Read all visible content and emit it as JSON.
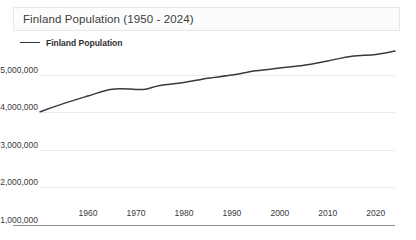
{
  "title": "Finland Population (1950 - 2024)",
  "legend": {
    "label": "Finland Population",
    "marker": "line-swatch-icon"
  },
  "colors": {
    "line": "#3a3a3a",
    "gridline": "#ebebeb",
    "axis": "#8c8c8c",
    "text": "#3a3a3a",
    "title_border": "#e8e8e8",
    "background": "#ffffff"
  },
  "chart_data": {
    "type": "line",
    "title": "Finland Population (1950 - 2024)",
    "xlabel": "",
    "ylabel": "",
    "xlim": [
      1950,
      2024
    ],
    "ylim": [
      1000000,
      5600000
    ],
    "grid": true,
    "legend_position": "top-left",
    "xticks": [
      1960,
      1970,
      1980,
      1990,
      2000,
      2010,
      2020
    ],
    "xtick_labels": [
      "1960",
      "1970",
      "1980",
      "1990",
      "2000",
      "2010",
      "2020"
    ],
    "yticks": [
      1000000,
      2000000,
      3000000,
      4000000,
      5000000
    ],
    "ytick_labels": [
      "1,000,000",
      "2,000,000",
      "3,000,000",
      "4,000,000",
      "5,000,000"
    ],
    "series": [
      {
        "name": "Finland Population",
        "color": "#3a3a3a",
        "x": [
          1950,
          1955,
          1960,
          1965,
          1970,
          1972,
          1975,
          1980,
          1985,
          1990,
          1995,
          2000,
          2005,
          2010,
          2015,
          2020,
          2024
        ],
        "values": [
          4009000,
          4235000,
          4430000,
          4612000,
          4606000,
          4612000,
          4711000,
          4788000,
          4902000,
          4986000,
          5099000,
          5176000,
          5246000,
          5363000,
          5487000,
          5534000,
          5625000
        ]
      }
    ]
  }
}
